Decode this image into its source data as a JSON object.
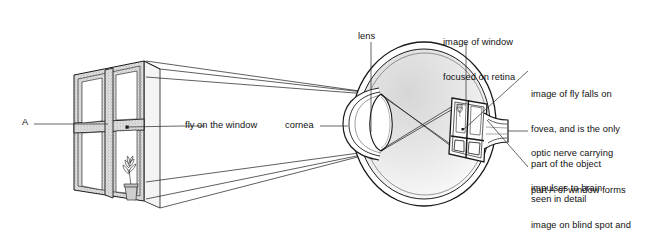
{
  "figure": {
    "title_text": "",
    "background_color": "#ffffff",
    "ink_color": "#1a1a1a",
    "width": 658,
    "height": 236
  },
  "labels": {
    "part_a": "A",
    "fly_on_window": "fly on the window",
    "cornea": "cornea",
    "lens": "lens",
    "image_of_window": "image of window\nfocused on retina",
    "image_of_window_line1": "image of window",
    "image_of_window_line2": "focused on retina",
    "fovea_note": "image of fly falls on\nfovea, and is the only\npart of the object\nseen in detail",
    "fovea_note_line1": "image of fly falls on",
    "fovea_note_line2": "fovea, and is the only",
    "fovea_note_line3": "part of the object",
    "fovea_note_line4": "seen in detail",
    "optic_nerve_note": "optic nerve carrying\nimpulses to brain",
    "optic_nerve_note_line1": "optic nerve carrying",
    "optic_nerve_note_line2": "impulses to brain",
    "blind_spot_note": "part A of window forms\nimage on blind spot and\nso cannot be seen",
    "blind_spot_note_line1": "part A of window forms",
    "blind_spot_note_line2": "image on blind spot and",
    "blind_spot_note_line3": "so cannot be seen"
  },
  "parts": {
    "window": "window-with-four-panes",
    "fly": "fly-dot-on-window-pane",
    "plant": "potted-plant-behind-window",
    "eyeball": "eyeball-cross-section",
    "cornea_shape": "cornea-bulge",
    "lens_shape": "biconvex-lens",
    "retina_image": "inverted-window-image-on-retina",
    "optic_nerve_shape": "optic-nerve-stalk",
    "rays": "four-light-rays-with-arrowheads"
  },
  "colors": {
    "ink": "#1a1a1a",
    "vitreous_fill": "#e9e9e9",
    "frame_stipple": "#c9c9c9",
    "leader": "#333333"
  }
}
